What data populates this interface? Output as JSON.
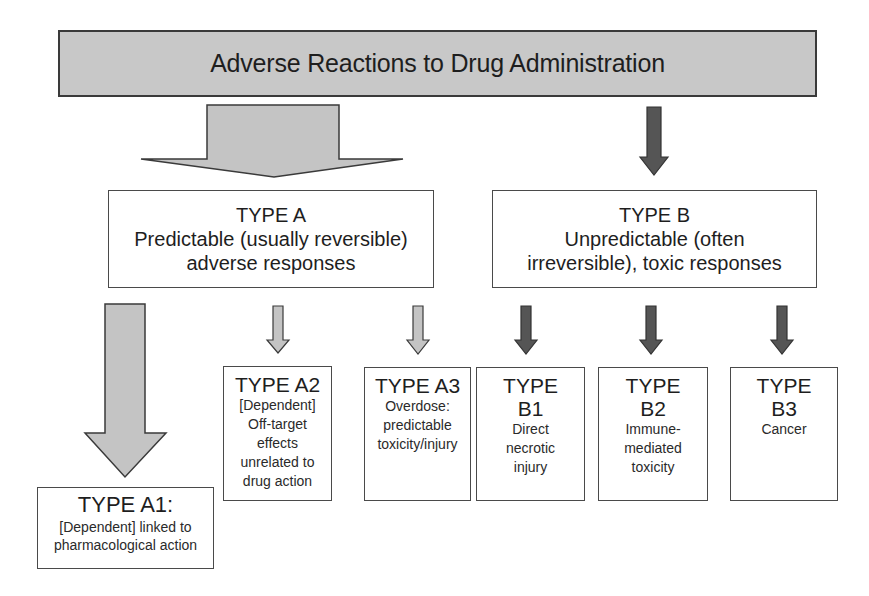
{
  "title": "Adverse Reactions to Drug Administration",
  "colors": {
    "header_fill": "#c8c8c8",
    "light_arrow": "#c4c4c4",
    "dark_arrow": "#555555",
    "border": "#4a4a4a"
  },
  "type_a": {
    "title": "TYPE A",
    "lines": [
      "Predictable (usually reversible)",
      "adverse responses"
    ]
  },
  "type_b": {
    "title": "TYPE B",
    "lines": [
      "Unpredictable (often",
      "irreversible), toxic responses"
    ]
  },
  "subtypes": {
    "a1": {
      "title": "TYPE A1:",
      "lines": [
        "[Dependent] linked to",
        "pharmacological action"
      ]
    },
    "a2": {
      "title": "TYPE A2",
      "lines": [
        "[Dependent]",
        "Off-target",
        "effects",
        "unrelated to",
        "drug action"
      ]
    },
    "a3": {
      "title": "TYPE A3",
      "lines": [
        "Overdose:",
        "predictable",
        "toxicity/injury"
      ]
    },
    "b1": {
      "title_lines": [
        "TYPE",
        "B1"
      ],
      "lines": [
        "Direct",
        "necrotic",
        "injury"
      ]
    },
    "b2": {
      "title_lines": [
        "TYPE",
        "B2"
      ],
      "lines": [
        "Immune-",
        "mediated",
        "toxicity"
      ]
    },
    "b3": {
      "title_lines": [
        "TYPE",
        "B3"
      ],
      "lines": [
        "Cancer"
      ]
    }
  }
}
